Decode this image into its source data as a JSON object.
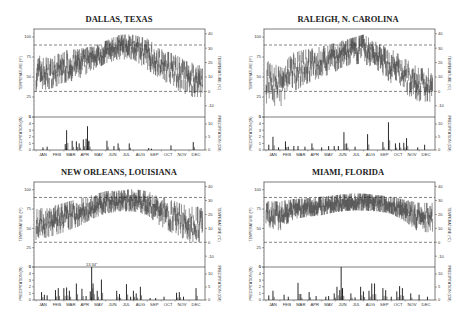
{
  "chart_data": [
    {
      "type": "line",
      "title": "DALLAS, TEXAS",
      "temperature": {
        "ylabel_left": "TEMPERATURE (°F)",
        "ylabel_right": "TEMPERATURE (°C)",
        "yticks_f": [
          0,
          25,
          50,
          75,
          100
        ],
        "yticks_c": [
          -10,
          0,
          10,
          20,
          30,
          40
        ],
        "ylim_f": [
          0,
          110
        ],
        "reference_lines_f": [
          32,
          90
        ],
        "monthly_range_f": [
          [
            35,
            75
          ],
          [
            38,
            70
          ],
          [
            45,
            80
          ],
          [
            50,
            82
          ],
          [
            60,
            85
          ],
          [
            70,
            92
          ],
          [
            75,
            100
          ],
          [
            75,
            100
          ],
          [
            62,
            95
          ],
          [
            50,
            82
          ],
          [
            38,
            75
          ],
          [
            28,
            65
          ]
        ]
      },
      "precipitation": {
        "ylabel_left": "PRECIPITATION (IN)",
        "ylabel_right": "PRECIPITATION (CM)",
        "yticks_in": [
          0,
          1,
          2,
          3,
          4,
          5
        ],
        "yticks_cm": [
          0,
          5,
          10
        ],
        "ylim_in": [
          0,
          5
        ],
        "events": [
          [
            0.5,
            0.4
          ],
          [
            0.8,
            0.5
          ],
          [
            2.1,
            0.9
          ],
          [
            2.2,
            3.0
          ],
          [
            2.6,
            1.4
          ],
          [
            2.9,
            1.3
          ],
          [
            3.1,
            1.0
          ],
          [
            3.4,
            1.6
          ],
          [
            3.6,
            1.7
          ],
          [
            3.7,
            3.6
          ],
          [
            3.8,
            1.4
          ],
          [
            5.1,
            1.4
          ],
          [
            5.6,
            0.6
          ],
          [
            5.9,
            1.0
          ],
          [
            6.7,
            1.0
          ],
          [
            8.1,
            0.3
          ],
          [
            8.3,
            0.2
          ],
          [
            9.7,
            0.7
          ],
          [
            11.3,
            1.2
          ]
        ]
      },
      "months": [
        "JAN",
        "FEB",
        "MAR",
        "APR",
        "MAY",
        "JUN",
        "JUL",
        "AUG",
        "SEP",
        "OCT",
        "NOV",
        "DEC"
      ]
    },
    {
      "type": "line",
      "title": "RALEIGH, N. CAROLINA",
      "temperature": {
        "ylabel_left": "TEMPERATURE (°F)",
        "ylabel_right": "TEMPERATURE (°C)",
        "yticks_f": [
          0,
          25,
          50,
          75,
          100
        ],
        "yticks_c": [
          -10,
          0,
          10,
          20,
          30,
          40
        ],
        "ylim_f": [
          0,
          110
        ],
        "reference_lines_f": [
          32,
          90
        ],
        "monthly_range_f": [
          [
            20,
            68
          ],
          [
            15,
            60
          ],
          [
            35,
            78
          ],
          [
            45,
            82
          ],
          [
            52,
            85
          ],
          [
            60,
            90
          ],
          [
            68,
            95
          ],
          [
            70,
            100
          ],
          [
            62,
            90
          ],
          [
            45,
            82
          ],
          [
            32,
            70
          ],
          [
            22,
            58
          ]
        ]
      },
      "precipitation": {
        "ylabel_left": "PRECIPITATION (IN)",
        "ylabel_right": "PRECIPITATION (CM)",
        "yticks_in": [
          0,
          1,
          2,
          3,
          4,
          5
        ],
        "yticks_cm": [
          0,
          5,
          10
        ],
        "ylim_in": [
          0,
          5
        ],
        "events": [
          [
            0.2,
            0.8
          ],
          [
            0.5,
            2.0
          ],
          [
            0.9,
            0.4
          ],
          [
            1.4,
            1.3
          ],
          [
            1.6,
            0.5
          ],
          [
            2.0,
            0.6
          ],
          [
            2.3,
            0.6
          ],
          [
            2.8,
            0.5
          ],
          [
            3.3,
            1.0
          ],
          [
            4.0,
            0.4
          ],
          [
            4.5,
            0.6
          ],
          [
            4.9,
            0.6
          ],
          [
            5.2,
            0.6
          ],
          [
            5.6,
            2.7
          ],
          [
            5.8,
            1.0
          ],
          [
            6.4,
            0.5
          ],
          [
            7.3,
            2.4
          ],
          [
            8.4,
            1.2
          ],
          [
            8.8,
            4.2
          ],
          [
            9.3,
            1.0
          ],
          [
            9.6,
            1.1
          ],
          [
            9.9,
            1.1
          ],
          [
            10.1,
            1.8
          ],
          [
            10.9,
            0.4
          ],
          [
            11.4,
            0.8
          ]
        ]
      },
      "months": [
        "JAN",
        "FEB",
        "MAR",
        "APR",
        "MAY",
        "JUN",
        "JUL",
        "AUG",
        "SEP",
        "OCT",
        "NOV",
        "DEC"
      ]
    },
    {
      "type": "line",
      "title": "NEW ORLEANS, LOUISIANA",
      "temperature": {
        "ylabel_left": "TEMPERATURE (°F)",
        "ylabel_right": "TEMPERATURE (°C)",
        "yticks_f": [
          0,
          25,
          50,
          75,
          100
        ],
        "yticks_c": [
          -10,
          0,
          10,
          20,
          30,
          40
        ],
        "ylim_f": [
          0,
          110
        ],
        "reference_lines_f": [
          32,
          90
        ],
        "monthly_range_f": [
          [
            38,
            72
          ],
          [
            42,
            75
          ],
          [
            48,
            80
          ],
          [
            55,
            85
          ],
          [
            65,
            90
          ],
          [
            72,
            95
          ],
          [
            75,
            96
          ],
          [
            75,
            98
          ],
          [
            70,
            95
          ],
          [
            55,
            88
          ],
          [
            45,
            82
          ],
          [
            35,
            75
          ]
        ]
      },
      "precipitation": {
        "ylabel_left": "PRECIPITATION (IN)",
        "ylabel_right": "PRECIPITATION (CM)",
        "yticks_in": [
          0,
          1,
          2,
          3,
          4,
          5
        ],
        "yticks_cm": [
          0,
          5,
          10
        ],
        "ylim_in": [
          0,
          5
        ],
        "annotation": "13.34\"",
        "events": [
          [
            0.4,
            1.2
          ],
          [
            0.6,
            0.8
          ],
          [
            0.8,
            0.7
          ],
          [
            1.4,
            1.5
          ],
          [
            1.6,
            1.8
          ],
          [
            2.0,
            1.8
          ],
          [
            2.2,
            1.9
          ],
          [
            2.4,
            1.4
          ],
          [
            2.9,
            2.5
          ],
          [
            3.3,
            1.7
          ],
          [
            3.6,
            0.6
          ],
          [
            3.9,
            1.3
          ],
          [
            4.0,
            5.0
          ],
          [
            4.1,
            2.5
          ],
          [
            4.4,
            1.4
          ],
          [
            4.7,
            3.1
          ],
          [
            5.8,
            1.4
          ],
          [
            6.0,
            0.9
          ],
          [
            6.5,
            2.4
          ],
          [
            6.8,
            0.5
          ],
          [
            7.0,
            1.4
          ],
          [
            7.2,
            1.0
          ],
          [
            7.5,
            2.0
          ],
          [
            8.2,
            0.3
          ],
          [
            8.6,
            0.3
          ],
          [
            9.2,
            0.5
          ],
          [
            10.1,
            1.1
          ],
          [
            10.3,
            1.2
          ],
          [
            10.6,
            0.5
          ],
          [
            11.5,
            1.8
          ]
        ]
      },
      "months": [
        "JAN",
        "FEB",
        "MAR",
        "APR",
        "MAY",
        "JUN",
        "JUL",
        "AUG",
        "SEP",
        "OCT",
        "NOV",
        "DEC"
      ]
    },
    {
      "type": "line",
      "title": "MIAMI, FLORIDA",
      "temperature": {
        "ylabel_left": "TEMPERATURE (°F)",
        "ylabel_right": "TEMPERATURE (°C)",
        "yticks_f": [
          0,
          25,
          50,
          75,
          100
        ],
        "yticks_c": [
          -10,
          0,
          10,
          20,
          30,
          40
        ],
        "ylim_f": [
          0,
          110
        ],
        "reference_lines_f": [
          32,
          90
        ],
        "monthly_range_f": [
          [
            55,
            82
          ],
          [
            50,
            82
          ],
          [
            65,
            85
          ],
          [
            68,
            86
          ],
          [
            70,
            88
          ],
          [
            74,
            90
          ],
          [
            76,
            92
          ],
          [
            76,
            92
          ],
          [
            75,
            90
          ],
          [
            72,
            88
          ],
          [
            62,
            84
          ],
          [
            48,
            80
          ]
        ]
      },
      "precipitation": {
        "ylabel_left": "PRECIPITATION (IN)",
        "ylabel_right": "PRECIPITATION (CM)",
        "yticks_in": [
          0,
          1,
          2,
          3,
          4,
          5
        ],
        "yticks_cm": [
          0,
          5,
          10
        ],
        "ylim_in": [
          0,
          5
        ],
        "events": [
          [
            0.2,
            0.7
          ],
          [
            0.5,
            1.4
          ],
          [
            1.3,
            0.8
          ],
          [
            1.6,
            0.5
          ],
          [
            2.3,
            2.6
          ],
          [
            2.5,
            0.9
          ],
          [
            3.1,
            1.2
          ],
          [
            3.6,
            0.6
          ],
          [
            4.3,
            0.5
          ],
          [
            4.5,
            0.6
          ],
          [
            4.9,
            1.0
          ],
          [
            5.1,
            2.0
          ],
          [
            5.3,
            1.5
          ],
          [
            5.4,
            5.0
          ],
          [
            5.5,
            1.8
          ],
          [
            6.1,
            1.0
          ],
          [
            6.4,
            0.4
          ],
          [
            6.8,
            2.0
          ],
          [
            7.0,
            1.3
          ],
          [
            7.4,
            1.4
          ],
          [
            7.6,
            2.5
          ],
          [
            7.8,
            2.5
          ],
          [
            8.4,
            1.8
          ],
          [
            8.6,
            1.5
          ],
          [
            9.0,
            0.5
          ],
          [
            9.4,
            1.3
          ],
          [
            9.6,
            2.1
          ],
          [
            9.8,
            1.8
          ],
          [
            10.4,
            1.0
          ],
          [
            11.0,
            0.8
          ],
          [
            11.6,
            0.5
          ]
        ]
      },
      "months": [
        "JAN",
        "FEB",
        "MAR",
        "APR",
        "MAY",
        "JUN",
        "JUL",
        "AUG",
        "SEP",
        "OCT",
        "NOV",
        "DEC"
      ]
    }
  ]
}
